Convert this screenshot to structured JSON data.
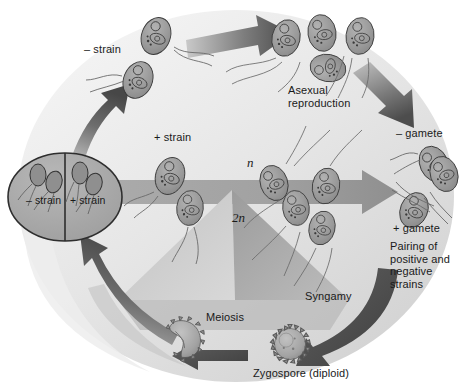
{
  "figure": {
    "background_color": "#ffffff",
    "ellipse_fill": "#e9e9e9",
    "cell_fill": "#9a9a9a",
    "cell_stroke": "#3d3d3d",
    "arrow_dark": "#4a4a4a",
    "arrow_mid": "#8d8d8d",
    "arrow_light": "#b4b4b4",
    "text_color": "#1a1a1a"
  },
  "labels": {
    "minus_strain": "– strain",
    "plus_strain": "+ strain",
    "asexual_reproduction": "Asexual\nreproduction",
    "minus_gamete": "– gamete",
    "plus_gamete": "+ gamete",
    "pairing": "Pairing of\npositive and\nnegative\nstrains",
    "haploid_n": "n",
    "diploid_2n": "2n",
    "syngamy": "Syngamy",
    "meiosis": "Meiosis",
    "zygospore": "Zygospore (diploid)"
  },
  "inset": {
    "name": "strain-inset-circle",
    "left_label": "– strain",
    "right_label": "+ strain",
    "left_cells": 2,
    "right_cells": 2
  },
  "stages": [
    {
      "name": "minus-strain-cells",
      "label": "– strain",
      "count": 2,
      "ploidy": "n"
    },
    {
      "name": "asexual-reproduction-cluster",
      "label": "Asexual reproduction",
      "count": 4,
      "ploidy": "n"
    },
    {
      "name": "minus-gamete-cell",
      "label": "– gamete",
      "count": 1,
      "ploidy": "n"
    },
    {
      "name": "plus-strain-cells",
      "label": "+ strain",
      "count": 2,
      "ploidy": "n"
    },
    {
      "name": "pairing-cells",
      "label": "Pairing of positive and negative strains",
      "count": 2,
      "ploidy": "n"
    },
    {
      "name": "plus-gamete-cell",
      "label": "+ gamete",
      "count": 1,
      "ploidy": "n"
    },
    {
      "name": "syngamy-cells",
      "label": "Syngamy",
      "count": 5,
      "ploidy": "n"
    },
    {
      "name": "zygospore-diploid",
      "label": "Zygospore (diploid)",
      "count": 1,
      "ploidy": "2n"
    },
    {
      "name": "germinating-zygospore",
      "label": "Meiosis",
      "count": 1,
      "ploidy": "2n"
    }
  ],
  "arrows": [
    {
      "name": "arrow-asexual",
      "from": "minus-strain-cells",
      "to": "asexual-reproduction-cluster"
    },
    {
      "name": "arrow-to-minus-gamete",
      "from": "asexual-reproduction-cluster",
      "to": "minus-gamete-cell"
    },
    {
      "name": "arrow-syngamy",
      "from": "pairing-cells",
      "to": "plus-gamete-cell"
    },
    {
      "name": "arrow-to-zygospore",
      "from": "syngamy-cells",
      "to": "zygospore-diploid"
    },
    {
      "name": "arrow-meiosis",
      "from": "zygospore-diploid",
      "to": "germinating-zygospore"
    },
    {
      "name": "arrow-germination",
      "from": "germinating-zygospore",
      "to": "strain-inset-circle"
    },
    {
      "name": "arrow-inset-to-minus-strain",
      "from": "strain-inset-circle",
      "to": "minus-strain-cells"
    }
  ]
}
